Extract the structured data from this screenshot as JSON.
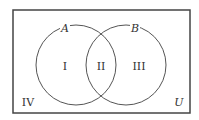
{
  "diagram": {
    "type": "venn",
    "universe_label": "U",
    "sets": [
      {
        "name": "A",
        "label": "A"
      },
      {
        "name": "B",
        "label": "B"
      }
    ],
    "regions": [
      {
        "id": "I",
        "label": "I",
        "description": "A only"
      },
      {
        "id": "II",
        "label": "II",
        "description": "A and B"
      },
      {
        "id": "III",
        "label": "III",
        "description": "B only"
      },
      {
        "id": "IV",
        "label": "IV",
        "description": "neither A nor B"
      }
    ],
    "colors": {
      "stroke": "#444444",
      "background": "#ffffff"
    }
  }
}
